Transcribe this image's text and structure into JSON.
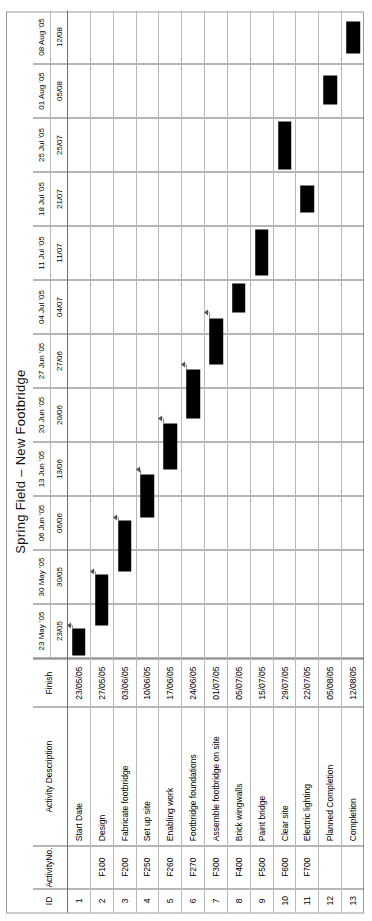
{
  "document": {
    "title": "Spring Field – New Footbridge"
  },
  "table": {
    "headers": {
      "id": "ID",
      "activity_no": "Activity No.",
      "activity_no_line1": "Activity",
      "activity_no_line2": "No.",
      "description": "Activity Description",
      "finish": "Finish"
    }
  },
  "weeks": [
    {
      "label": "23 May '05",
      "short": "23/05"
    },
    {
      "label": "30 May '05",
      "short": "30/05"
    },
    {
      "label": "06 Jun '05",
      "short": "06/06"
    },
    {
      "label": "13 Jun '05",
      "short": "13/06"
    },
    {
      "label": "20 Jun '05",
      "short": "20/06"
    },
    {
      "label": "27 Jun '05",
      "short": "27/06"
    },
    {
      "label": "04 Jul '05",
      "short": "04/07"
    },
    {
      "label": "11 Jul '05",
      "short": "11/07"
    },
    {
      "label": "18 Jul '05",
      "short": "21/07"
    },
    {
      "label": "25 Jul '05",
      "short": "25/07"
    },
    {
      "label": "01 Aug '05",
      "short": "05/08"
    },
    {
      "label": "08 Aug '05",
      "short": "12/08"
    }
  ],
  "rows": [
    {
      "id": "1",
      "activity_no": "",
      "description": "Start Date",
      "finish": "23/05/05"
    },
    {
      "id": "2",
      "activity_no": "F100",
      "description": "Design",
      "finish": "27/05/05"
    },
    {
      "id": "3",
      "activity_no": "F200",
      "description": "Fabricate footbridge",
      "finish": "03/06/05"
    },
    {
      "id": "4",
      "activity_no": "F250",
      "description": "Set up site",
      "finish": "10/06/05"
    },
    {
      "id": "5",
      "activity_no": "F260",
      "description": "Enabling work",
      "finish": "17/06/05"
    },
    {
      "id": "6",
      "activity_no": "F270",
      "description": "Footbridge foundations",
      "finish": "24/06/05"
    },
    {
      "id": "7",
      "activity_no": "F300",
      "description": "Assemble footbridge on site",
      "finish": "01/07/05"
    },
    {
      "id": "8",
      "activity_no": "F400",
      "description": "Brick wingwalls",
      "finish": "05/07/05"
    },
    {
      "id": "9",
      "activity_no": "F500",
      "description": "Paint bridge",
      "finish": "15/07/05"
    },
    {
      "id": "10",
      "activity_no": "F600",
      "description": "Clear site",
      "finish": "29/07/05"
    },
    {
      "id": "11",
      "activity_no": "F700",
      "description": "Electric lighting",
      "finish": "22/07/05"
    },
    {
      "id": "12",
      "activity_no": "",
      "description": "Planned Completion",
      "finish": "05/08/05"
    },
    {
      "id": "13",
      "activity_no": "",
      "description": "Completion",
      "finish": "12/08/05"
    }
  ],
  "chart_data": {
    "type": "bar",
    "title": "Spring Field – New Footbridge",
    "xlabel": "",
    "ylabel": "",
    "grid": true,
    "legend": "none",
    "x": [
      "23 May '05",
      "30 May '05",
      "06 Jun '05",
      "13 Jun '05",
      "20 Jun '05",
      "27 Jun '05",
      "04 Jul '05",
      "11 Jul '05",
      "18 Jul '05",
      "25 Jul '05",
      "01 Aug '05",
      "08 Aug '05"
    ],
    "categories": [
      "Start Date",
      "Design",
      "Fabricate footbridge",
      "Set up site",
      "Enabling work",
      "Footbridge foundations",
      "Assemble footbridge on site",
      "Brick wingwalls",
      "Paint bridge",
      "Clear site",
      "Electric lighting",
      "Planned Completion",
      "Completion"
    ],
    "bars": [
      {
        "id": "1",
        "task": "Start Date",
        "start_week": 0.05,
        "end_week": 0.55,
        "finish": "23/05/05"
      },
      {
        "id": "2",
        "task": "Design",
        "start_week": 0.62,
        "end_week": 1.55,
        "finish": "27/05/05"
      },
      {
        "id": "3",
        "task": "Fabricate footbridge",
        "start_week": 1.62,
        "end_week": 2.55,
        "finish": "03/06/05"
      },
      {
        "id": "4",
        "task": "Set up site",
        "start_week": 2.62,
        "end_week": 3.4,
        "finish": "10/06/05"
      },
      {
        "id": "5",
        "task": "Enabling work",
        "start_week": 3.5,
        "end_week": 4.35,
        "finish": "17/06/05"
      },
      {
        "id": "6",
        "task": "Footbridge foundations",
        "start_week": 4.45,
        "end_week": 5.35,
        "finish": "24/06/05"
      },
      {
        "id": "7",
        "task": "Assemble footbridge on site",
        "start_week": 5.45,
        "end_week": 6.3,
        "finish": "01/07/05"
      },
      {
        "id": "8",
        "task": "Brick wingwalls",
        "start_week": 6.4,
        "end_week": 6.95,
        "finish": "05/07/05"
      },
      {
        "id": "9",
        "task": "Paint bridge",
        "start_week": 7.1,
        "end_week": 7.95,
        "finish": "15/07/05"
      },
      {
        "id": "10",
        "task": "Clear site",
        "start_week": 9.05,
        "end_week": 9.95,
        "finish": "29/07/05"
      },
      {
        "id": "11",
        "task": "Electric lighting",
        "start_week": 8.25,
        "end_week": 8.75,
        "finish": "22/07/05"
      },
      {
        "id": "12",
        "task": "Planned Completion",
        "start_week": 10.25,
        "end_week": 10.8,
        "finish": "05/08/05"
      },
      {
        "id": "13",
        "task": "Completion",
        "start_week": 11.2,
        "end_week": 11.8,
        "finish": "12/08/05"
      }
    ],
    "links": [
      {
        "from": "1",
        "to": "2"
      },
      {
        "from": "2",
        "to": "3"
      },
      {
        "from": "3",
        "to": "4"
      },
      {
        "from": "4",
        "to": "5"
      },
      {
        "from": "5",
        "to": "6"
      },
      {
        "from": "6",
        "to": "7"
      },
      {
        "from": "7",
        "to": "8"
      }
    ]
  }
}
